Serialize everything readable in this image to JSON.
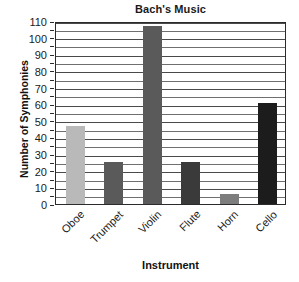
{
  "chart_data": {
    "type": "bar",
    "title": "Bach's Music",
    "xlabel": "Instrument",
    "ylabel": "Number of Symphonies",
    "categories": [
      "Oboe",
      "Trumpet",
      "Violin",
      "Flute",
      "Horn",
      "Cello"
    ],
    "values": [
      47,
      25,
      107,
      25,
      6,
      61
    ],
    "bar_colors": [
      "#b9b9b9",
      "#5a5a5a",
      "#5a5a5a",
      "#3a3a3a",
      "#7d7d7d",
      "#1c1c1c"
    ],
    "ylim": [
      0,
      110
    ],
    "ytick_values": [
      0,
      10,
      20,
      30,
      40,
      50,
      60,
      70,
      80,
      90,
      100,
      110
    ],
    "ytick_labels": [
      "0",
      "10",
      "20",
      "30",
      "40",
      "50",
      "60",
      "70",
      "80",
      "90",
      "100",
      "110"
    ],
    "minor_tick_step": 5,
    "grid": true,
    "grid_axis": "y",
    "legend": false,
    "legend_position": "none",
    "frame_color": "#2b2b2b",
    "background": "#ffffff"
  }
}
